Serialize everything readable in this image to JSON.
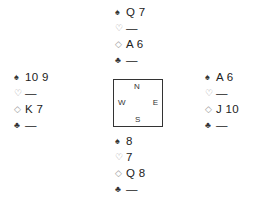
{
  "diagram": {
    "type": "bridge-deal",
    "suit_symbols": {
      "spades": "♠",
      "hearts": "♡",
      "diamonds": "◇",
      "clubs": "♣"
    },
    "compass": {
      "north": "N",
      "south": "S",
      "east": "E",
      "west": "W"
    },
    "hands": {
      "north": {
        "spades": "Q 7",
        "hearts": "—",
        "diamonds": "A 6",
        "clubs": "—"
      },
      "west": {
        "spades": "10 9",
        "hearts": "—",
        "diamonds": "K 7",
        "clubs": "—"
      },
      "east": {
        "spades": "A 6",
        "hearts": "—",
        "diamonds": "J 10",
        "clubs": "—"
      },
      "south": {
        "spades": "8",
        "hearts": "7",
        "diamonds": "Q 8",
        "clubs": "—"
      }
    }
  }
}
